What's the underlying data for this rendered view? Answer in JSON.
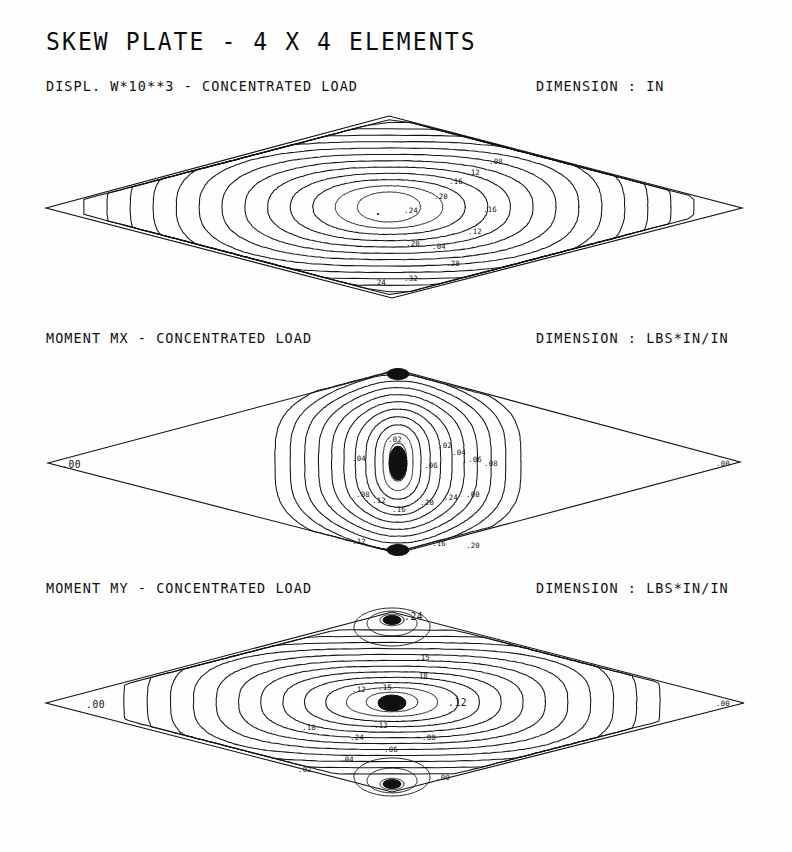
{
  "document": {
    "title": "SKEW PLATE - 4 X 4 ELEMENTS",
    "background_color": "#ffffff",
    "ink_color": "#111111"
  },
  "panels": [
    {
      "id": "displacement",
      "caption": "DISPL. W*10**3 - CONCENTRATED LOAD",
      "dimension": "DIMENSION : IN",
      "corner_labels": {
        "left": "",
        "right": ""
      }
    },
    {
      "id": "moment-mx",
      "caption": "MOMENT MX - CONCENTRATED LOAD",
      "dimension": "DIMENSION : LBS*IN/IN",
      "corner_labels": {
        "left": ".00",
        "right": ".00"
      }
    },
    {
      "id": "moment-my",
      "caption": "MOMENT MY - CONCENTRATED LOAD",
      "dimension": "DIMENSION : LBS*IN/IN",
      "corner_labels": {
        "left": ".00",
        "right": ".00"
      }
    }
  ],
  "chart_data": [
    {
      "type": "contour",
      "id": "displacement",
      "title": "DISPL. W*10**3 - CONCENTRATED LOAD",
      "units": "IN",
      "domain": "skew rhombic plate, 4 x 4 elements",
      "plate_vertices": [
        [
          46,
          208
        ],
        [
          389,
          116
        ],
        [
          742,
          208
        ],
        [
          392,
          298
        ]
      ],
      "peak_location": [
        389,
        207
      ],
      "levels": [
        ".04",
        ".08",
        ".12",
        ".16",
        ".20",
        ".24",
        ".28",
        ".32",
        ".36",
        ".40",
        ".44",
        ".48"
      ],
      "n_contours": 13,
      "label_text": [
        ".24",
        ".20",
        ".16",
        ".12",
        ".08",
        ".04",
        ".28",
        ".32"
      ],
      "grid": false,
      "legend": "none",
      "description": "Concentric closed contours centered slightly left of plate center; roughly elliptical, elongated along the plate long axis."
    },
    {
      "type": "contour",
      "id": "moment-mx",
      "title": "MOMENT MX - CONCENTRATED LOAD",
      "units": "LBS*IN/IN",
      "domain": "skew rhombic plate, 4 x 4 elements",
      "plate_vertices": [
        [
          48,
          463
        ],
        [
          398,
          370
        ],
        [
          740,
          462
        ],
        [
          398,
          553
        ]
      ],
      "peak_location": [
        398,
        462
      ],
      "levels": [
        ".02",
        ".04",
        ".06",
        ".08",
        ".10",
        ".12",
        ".16",
        ".20",
        ".24"
      ],
      "n_contours": 11,
      "label_text": [
        ".00",
        ".02",
        ".04",
        ".06",
        ".08",
        ".12",
        ".16",
        ".20",
        ".24"
      ],
      "grid": false,
      "legend": "none",
      "description": "Vertically elongated contours pinched toward the top and bottom vertices of the rhombus, with a solid dark saturated core at the load point."
    },
    {
      "type": "contour",
      "id": "moment-my",
      "title": "MOMENT MY - CONCENTRATED LOAD",
      "units": "LBS*IN/IN",
      "domain": "skew rhombic plate, 4 x 4 elements",
      "plate_vertices": [
        [
          46,
          703
        ],
        [
          392,
          612
        ],
        [
          744,
          703
        ],
        [
          392,
          792
        ]
      ],
      "peak_location": [
        392,
        702
      ],
      "levels": [
        ".02",
        ".04",
        ".06",
        ".08",
        ".10",
        ".12",
        ".15",
        ".18",
        ".24"
      ],
      "n_contours": 12,
      "label_text": [
        ".24",
        ".18",
        ".15",
        ".12",
        ".08",
        ".06",
        ".04",
        ".02",
        ".00"
      ],
      "grid": false,
      "legend": "none",
      "description": "Horizontally elongated concentric contours about the load point, plus small separate closed loops near the top and bottom vertices labelled .24."
    }
  ]
}
